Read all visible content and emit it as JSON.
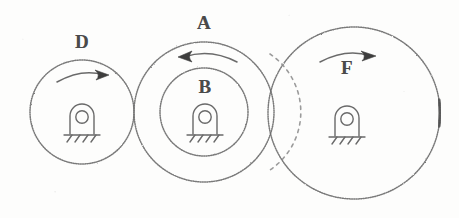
{
  "figure": {
    "background_color": "#fdfdfc",
    "ink_color": "#6a6a6a",
    "ink_color_dark": "#3f3f3f",
    "labels": [
      {
        "id": "label-A",
        "text": "A",
        "x": 204,
        "y": 22,
        "note": "outer wheel A, upper centre"
      },
      {
        "id": "label-B",
        "text": "B",
        "x": 205,
        "y": 86,
        "note": "inner wheel B, concentric with A"
      },
      {
        "id": "label-D",
        "text": "D",
        "x": 82,
        "y": 41,
        "note": "left wheel D"
      },
      {
        "id": "label-F",
        "text": "F",
        "x": 347,
        "y": 67,
        "note": "right wheel F"
      }
    ],
    "circles": [
      {
        "id": "circle-D",
        "label": "D",
        "cx": 82,
        "cy": 112,
        "r": 52,
        "style": "dotted-sketch"
      },
      {
        "id": "circle-A",
        "label": "A",
        "cx": 204,
        "cy": 112,
        "r": 70,
        "style": "dotted-sketch"
      },
      {
        "id": "circle-B",
        "label": "B",
        "cx": 204,
        "cy": 112,
        "r": 44,
        "style": "dotted-sketch"
      },
      {
        "id": "circle-F",
        "label": "F",
        "cx": 354,
        "cy": 113,
        "r": 86,
        "style": "dotted-sketch"
      }
    ],
    "dashed_arc": {
      "id": "dashed-arc-overlap",
      "note": "dashed arc in the A/F overlap region, bulging right",
      "cx": 204,
      "cy": 112,
      "r": 70,
      "style": "dashed"
    },
    "edge_mark": {
      "id": "thick-edge-mark-F",
      "note": "short thickened segment on right rim of wheel F",
      "x": 437,
      "y": 113
    },
    "rotation_arrows": [
      {
        "id": "arrow-D",
        "for": "D",
        "direction": "clockwise",
        "head": "right",
        "cx": 82,
        "cy": 78
      },
      {
        "id": "arrow-A",
        "for": "A",
        "direction": "counterclockwise",
        "head": "left",
        "cx": 204,
        "cy": 55
      },
      {
        "id": "arrow-F",
        "for": "F",
        "direction": "clockwise",
        "head": "right",
        "cx": 347,
        "cy": 58
      }
    ],
    "bearings": [
      {
        "id": "bearing-D",
        "for": "D",
        "cx": 82,
        "cy": 118
      },
      {
        "id": "bearing-B",
        "for": "B",
        "cx": 205,
        "cy": 118
      },
      {
        "id": "bearing-F",
        "for": "F",
        "cx": 347,
        "cy": 120
      }
    ],
    "legend": {
      "bearing_symbol": "fixed-bearing-ground-symbol",
      "arrow_symbol": "curved-rotation-arrow"
    }
  }
}
